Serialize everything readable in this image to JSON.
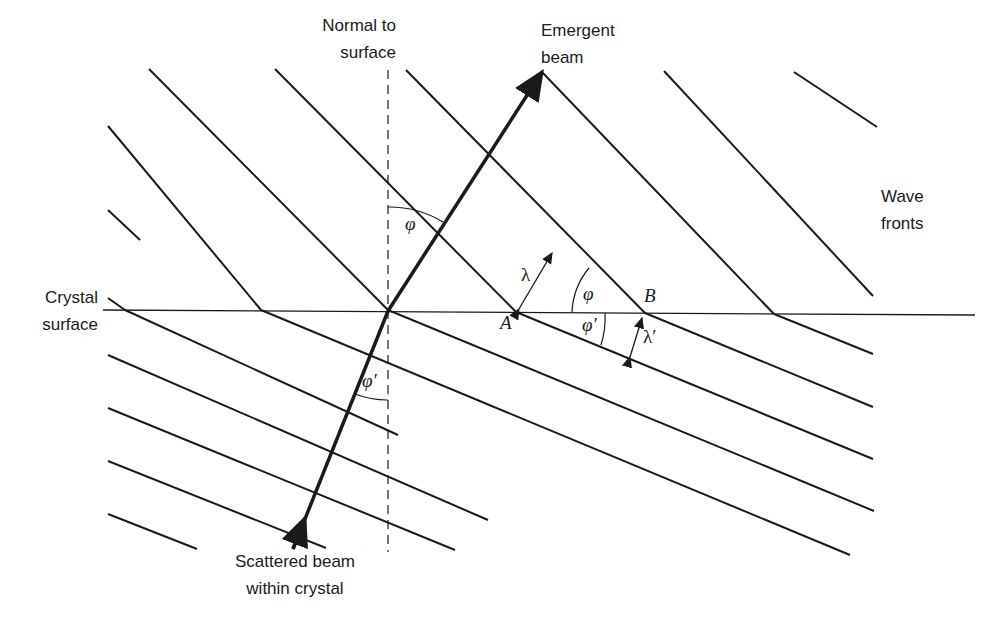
{
  "labels": {
    "normal": [
      "Normal to",
      "surface"
    ],
    "emergent": [
      "Emergent",
      "beam"
    ],
    "wave_fronts": [
      "Wave",
      "fronts"
    ],
    "crystal_surface": [
      "Crystal",
      "surface"
    ],
    "scattered": [
      "Scattered beam",
      "within crystal"
    ]
  },
  "symbols": {
    "phi_top": "φ",
    "phi_bottom": "φ′",
    "phi_triangle": "φ",
    "phi_prime_triangle": "φ′",
    "lambda": "λ",
    "lambda_prime": "λ′",
    "point_a": "A",
    "point_b": "B"
  },
  "colors": {
    "ink": "#1a1a1a",
    "background": "#ffffff"
  }
}
